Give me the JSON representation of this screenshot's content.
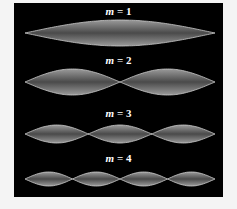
{
  "figure": {
    "background_color": "#000000",
    "wave_color": "#c8c8c8",
    "modes": [
      {
        "m": "1",
        "label_var": "m",
        "label_eq": " = 1",
        "loops": 1
      },
      {
        "m": "2",
        "label_var": "m",
        "label_eq": " = 2",
        "loops": 2
      },
      {
        "m": "3",
        "label_var": "m",
        "label_eq": " = 3",
        "loops": 3
      },
      {
        "m": "4",
        "label_var": "m",
        "label_eq": " = 4",
        "loops": 4
      }
    ]
  }
}
